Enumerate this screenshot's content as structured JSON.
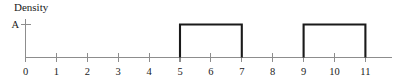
{
  "figure": {
    "title": "Density",
    "background_color": "#ffffff"
  },
  "chart_data": {
    "type": "area",
    "title": "Density",
    "xlabel": "",
    "ylabel": "Density",
    "x_ticks": [
      0,
      1,
      2,
      3,
      4,
      5,
      6,
      7,
      8,
      9,
      10,
      11
    ],
    "x_tick_labels": [
      "0",
      "1",
      "2",
      "3",
      "4",
      "5",
      "6",
      "7",
      "8",
      "9",
      "10",
      "11"
    ],
    "xlim": [
      0,
      11.9
    ],
    "y_ticks": [
      1
    ],
    "y_tick_labels": [
      "A"
    ],
    "ylim": [
      0,
      1.35
    ],
    "grid": false,
    "legend": null,
    "series": [
      {
        "name": "density",
        "kind": "step",
        "color": "#1a1a1a",
        "intervals": [
          {
            "x_start": 5,
            "x_end": 7,
            "height": 1,
            "height_label": "A"
          },
          {
            "x_start": 9,
            "x_end": 11,
            "height": 1,
            "height_label": "A"
          }
        ],
        "x": [
          0,
          5,
          5,
          7,
          7,
          9,
          9,
          11,
          11,
          11.9
        ],
        "values": [
          0,
          0,
          1,
          1,
          0,
          0,
          1,
          1,
          0,
          0
        ]
      }
    ],
    "axis_color": "#8d8d8d",
    "curve_color": "#1a1a1a"
  }
}
